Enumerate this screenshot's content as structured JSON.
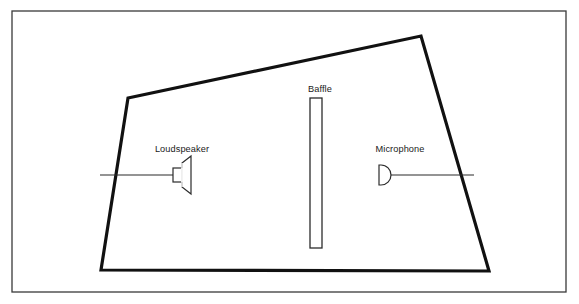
{
  "figure": {
    "background_color": "#ffffff",
    "frame_color": "#3a3a3a",
    "room_outline_color": "#111111",
    "line_color": "#2b2b2b"
  },
  "frame": {
    "name": "outer-border",
    "x": 12,
    "y": 11,
    "width": 554,
    "height": 281,
    "stroke_width": 1.3
  },
  "room": {
    "name": "room-outline",
    "shape": "irregular-quadrilateral",
    "stroke_width": 3.2,
    "points": "128,98 421,36 489,271 101,270",
    "vertices": [
      {
        "label": "top-left",
        "x": 128,
        "y": 98
      },
      {
        "label": "top-right",
        "x": 421,
        "y": 36
      },
      {
        "label": "bottom-right",
        "x": 489,
        "y": 271
      },
      {
        "label": "bottom-left",
        "x": 101,
        "y": 270
      }
    ]
  },
  "baffle": {
    "label": "Baffle",
    "label_x": 320,
    "label_y": 92,
    "x": 310,
    "y": 98,
    "width": 12,
    "height": 150,
    "stroke_width": 1.3
  },
  "loudspeaker": {
    "label": "Loudspeaker",
    "label_x": 182,
    "label_y": 152,
    "icon": "loudspeaker-icon",
    "axis_y": 175,
    "lead_line": {
      "x1": 100,
      "x2": 173
    },
    "body": {
      "x": 173,
      "y": 168,
      "width": 9,
      "height": 14
    },
    "cone": "182,163 191,157 191,193 182,182",
    "stroke_width": 1.2
  },
  "microphone": {
    "label": "Microphone",
    "label_x": 400,
    "label_y": 152,
    "icon": "microphone-icon",
    "axis_y": 175,
    "lead_line": {
      "x1": 388,
      "x2": 474
    },
    "capsule": "379,166 383,166 387,169 388,175 387,181 383,184 379,184 379,166",
    "stroke_width": 1.2
  }
}
